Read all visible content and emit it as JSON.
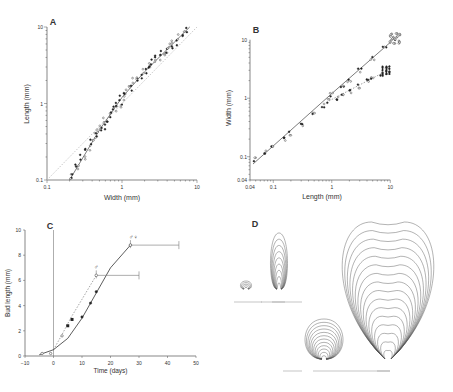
{
  "figure": {
    "panels": [
      "A",
      "B",
      "C",
      "D"
    ]
  },
  "chart_data": [
    {
      "panel": "A",
      "type": "scatter",
      "title": "A",
      "xlabel": "Width  (mm)",
      "ylabel": "Length  (mm)",
      "xscale": "log",
      "yscale": "log",
      "xlim": [
        0.1,
        10
      ],
      "ylim": [
        0.1,
        10
      ],
      "xticks": [
        "0.1",
        "1",
        "10"
      ],
      "yticks": [
        "0.1",
        "1",
        "10"
      ],
      "series": [
        {
          "name": "observations",
          "x": [
            0.21,
            0.25,
            0.3,
            0.35,
            0.4,
            0.45,
            0.5,
            0.55,
            0.6,
            0.7,
            0.8,
            0.9,
            1.0,
            1.1,
            1.3,
            1.5,
            1.7,
            2.0,
            2.3,
            2.6,
            3.0,
            3.5,
            4.0,
            4.5,
            5.0,
            6.0,
            7.0
          ],
          "y": [
            0.11,
            0.15,
            0.2,
            0.26,
            0.32,
            0.38,
            0.45,
            0.5,
            0.6,
            0.72,
            0.85,
            0.95,
            1.2,
            1.4,
            1.6,
            2.0,
            2.2,
            2.7,
            3.1,
            3.5,
            4.0,
            4.5,
            5.0,
            5.6,
            6.2,
            7.5,
            9.0
          ]
        },
        {
          "name": "fit",
          "type": "line",
          "x": [
            0.2,
            0.5,
            1,
            2,
            8
          ],
          "y": [
            0.1,
            0.45,
            1.2,
            2.6,
            10
          ]
        },
        {
          "name": "isometry",
          "type": "dotted-line",
          "x": [
            0.1,
            10
          ],
          "y": [
            0.1,
            10
          ]
        }
      ]
    },
    {
      "panel": "B",
      "type": "scatter",
      "title": "B",
      "xlabel": "Length  (mm)",
      "ylabel": "Width  (mm)",
      "xscale": "log",
      "yscale": "log",
      "xlim": [
        0.04,
        10
      ],
      "ylim": [
        0.04,
        10
      ],
      "xticks": [
        "0.04",
        "0.1",
        "1",
        "10"
      ],
      "yticks": [
        "0.04",
        "0.1",
        "1",
        "10"
      ],
      "series": [
        {
          "name": "upper branch",
          "x": [
            0.05,
            0.07,
            0.1,
            0.15,
            0.2,
            0.3,
            0.5,
            0.7,
            1.0,
            1.5,
            2.0,
            3.0,
            5.0,
            8.0,
            12.0
          ],
          "y": [
            0.09,
            0.12,
            0.15,
            0.2,
            0.25,
            0.35,
            0.55,
            0.75,
            1.15,
            1.6,
            2.0,
            3.0,
            4.8,
            7.5,
            10.5
          ]
        },
        {
          "name": "lower branch",
          "x": [
            0.9,
            1.2,
            1.6,
            2.0,
            3.0,
            4.0,
            5.0,
            7.0,
            9.0
          ],
          "y": [
            0.9,
            1.0,
            1.15,
            1.3,
            1.6,
            2.0,
            2.2,
            2.6,
            3.1
          ]
        },
        {
          "name": "fit",
          "type": "line",
          "x": [
            0.045,
            1,
            10
          ],
          "y": [
            0.075,
            1.2,
            9
          ]
        },
        {
          "name": "fit lower",
          "type": "dotted-line",
          "x": [
            0.9,
            9
          ],
          "y": [
            0.9,
            3
          ]
        }
      ]
    },
    {
      "panel": "C",
      "type": "line",
      "title": "C",
      "xlabel": "Time  (days)",
      "ylabel": "Bud length  (mm)",
      "xlim": [
        -10,
        50
      ],
      "ylim": [
        0,
        10
      ],
      "xticks": [
        "-10",
        "0",
        "10",
        "20",
        "30",
        "40",
        "50"
      ],
      "yticks": [
        "0",
        "2",
        "4",
        "6",
        "8",
        "10"
      ],
      "annotations": [
        "♂",
        "♂♀"
      ],
      "series": [
        {
          "name": "♂ (filled)",
          "x": [
            5,
            6.5
          ],
          "y": [
            2.4,
            2.9
          ]
        },
        {
          "name": "♂♀ (open)",
          "x": [
            -4,
            -1,
            3,
            10,
            13,
            15,
            27
          ],
          "y": [
            0.2,
            0.2,
            1.6,
            3.1,
            4.2,
            5.1,
            8.8
          ]
        },
        {
          "name": "♂ curve",
          "type": "dotted-line",
          "x": [
            0,
            3,
            6,
            10,
            15
          ],
          "y": [
            0.5,
            1.7,
            3.0,
            4.5,
            6.4
          ]
        },
        {
          "name": "♂♀ curve",
          "type": "line",
          "x": [
            -5,
            0,
            5,
            10,
            15,
            20,
            27
          ],
          "y": [
            0.1,
            0.5,
            1.4,
            3.0,
            5.0,
            7.0,
            8.8
          ]
        },
        {
          "name": "♂ endpoint",
          "x": [
            15
          ],
          "y": [
            6.4
          ],
          "xerr_to": 30
        },
        {
          "name": "♂♀ endpoint",
          "x": [
            27
          ],
          "y": [
            8.8
          ],
          "xerr_to": 44
        }
      ]
    },
    {
      "panel": "D",
      "type": "diagram",
      "title": "D",
      "description": "Successive bud outline contours (small and large, side and front views) with scale bars"
    }
  ]
}
